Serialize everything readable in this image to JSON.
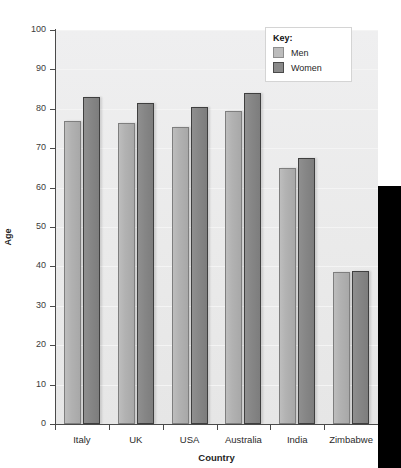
{
  "top_strip": {
    "left_fragment": "",
    "right_fragment": ""
  },
  "chart_data": {
    "type": "bar",
    "title": "",
    "xlabel": "Country",
    "ylabel": "Age",
    "ylim": [
      0,
      100
    ],
    "ytick_step": 10,
    "ytick_labels": [
      "0",
      "10",
      "20",
      "30",
      "40",
      "50",
      "60",
      "70",
      "80",
      "90",
      "100"
    ],
    "ytick_values": [
      0,
      10,
      20,
      30,
      40,
      50,
      60,
      70,
      80,
      90,
      100
    ],
    "grid": true,
    "legend_position": "top-right",
    "legend_title": "Key:",
    "categories": [
      "Italy",
      "UK",
      "USA",
      "Australia",
      "India",
      "Zimbabwe"
    ],
    "series": [
      {
        "name": "Men",
        "color": "#b2b2b2",
        "values": [
          77,
          76.5,
          75.5,
          79.5,
          65,
          38.5
        ]
      },
      {
        "name": "Women",
        "color": "#868686",
        "values": [
          83,
          81.5,
          80.5,
          84,
          67.5,
          38.8
        ]
      }
    ]
  },
  "legend": {
    "title": "Key:",
    "entries": [
      {
        "label": "Men",
        "swatch": "men"
      },
      {
        "label": "Women",
        "swatch": "women"
      }
    ]
  },
  "axes": {
    "y_title": "Age",
    "x_title": "Country"
  }
}
